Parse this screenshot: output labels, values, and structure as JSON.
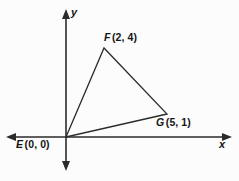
{
  "figure": {
    "background_color": "#fcfcfc",
    "stroke_color": "#2b2b2b",
    "text_color": "#151515"
  },
  "axes": {
    "x_label": "x",
    "y_label": "y",
    "origin_px": {
      "x": 66,
      "y": 137
    },
    "x_axis_px": {
      "x1": 7,
      "y1": 137,
      "x2": 231,
      "y2": 137
    },
    "y_axis_px": {
      "x1": 66,
      "y1": 10,
      "x2": 66,
      "y2": 170
    },
    "arrows": [
      "left",
      "right",
      "up",
      "down"
    ]
  },
  "points": [
    {
      "id": "E",
      "name": "E",
      "coords": "(0, 0)",
      "label": "E (0, 0)",
      "x": 0,
      "y": 0,
      "px": {
        "x": 66,
        "y": 137
      }
    },
    {
      "id": "F",
      "name": "F",
      "coords": "(2, 4)",
      "label": "F (2, 4)",
      "x": 2,
      "y": 4,
      "px": {
        "x": 104,
        "y": 48
      }
    },
    {
      "id": "G",
      "name": "G",
      "coords": "(5, 1)",
      "label": "G (5, 1)",
      "x": 5,
      "y": 1,
      "px": {
        "x": 167,
        "y": 114
      }
    }
  ],
  "shape": {
    "type": "triangle",
    "vertices": [
      "E",
      "F",
      "G"
    ],
    "filled": false,
    "points_attr": "66,137 104,48 167,114"
  },
  "chart_data": {
    "type": "scatter",
    "xlabel": "x",
    "ylabel": "y",
    "grid": false,
    "legend": "none",
    "xlim": [
      -1,
      6
    ],
    "ylim": [
      -1,
      5
    ],
    "series": [
      {
        "name": "Triangle EFG",
        "labels": [
          "E (0, 0)",
          "F (2, 4)",
          "G (5, 1)"
        ],
        "x": [
          0,
          2,
          5
        ],
        "y": [
          0,
          4,
          1
        ]
      }
    ],
    "annotations": [
      "E (0, 0)",
      "F (2, 4)",
      "G (5, 1)"
    ]
  }
}
